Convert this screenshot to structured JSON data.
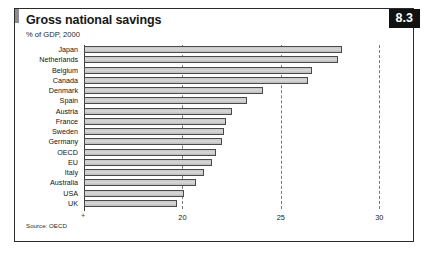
{
  "figure": {
    "number_badge": "8.3",
    "title": "Gross national savings",
    "subtitle": "% of GDP, 2000",
    "source": "Source: OECD"
  },
  "chart_data": {
    "type": "bar",
    "orientation": "horizontal",
    "title": "Gross national savings",
    "subtitle": "% of GDP, 2000",
    "xlabel": "",
    "ylabel": "",
    "xlim": [
      15,
      30.8
    ],
    "grid": true,
    "gridlines": [
      20,
      25,
      30
    ],
    "xticks": [
      "20",
      "25",
      "30"
    ],
    "axis_origin_label": "+",
    "legend": null,
    "categories": [
      "Japan",
      "Netherlands",
      "Belgium",
      "Canada",
      "Denmark",
      "Spain",
      "Austria",
      "France",
      "Sweden",
      "Germany",
      "OECD",
      "EU",
      "Italy",
      "Australia",
      "USA",
      "UK"
    ],
    "values": [
      28.1,
      27.9,
      26.6,
      26.4,
      24.1,
      23.3,
      22.5,
      22.2,
      22.1,
      22.0,
      21.7,
      21.5,
      21.1,
      20.7,
      20.1,
      19.7
    ],
    "bar_color": "#d0d0d0",
    "bar_edge_color": "#4a4a4a",
    "source": "Source: OECD"
  }
}
